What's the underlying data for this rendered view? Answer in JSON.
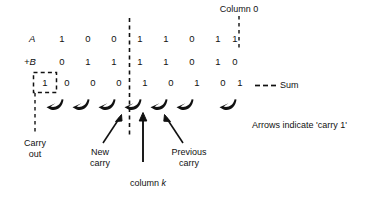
{
  "figure": {
    "labels": {
      "column0": "Column 0",
      "sum": "Sum",
      "arrows_note": "Arrows indicate 'carry 1'",
      "carry_out_line1": "Carry",
      "carry_out_line2": "out",
      "new_carry_line1": "New",
      "new_carry_line2": "carry",
      "previous_carry_line1": "Previous",
      "previous_carry_line2": "carry",
      "column_k_prefix": "column ",
      "column_k_var": "k"
    },
    "rows": [
      {
        "name": "row-a",
        "label": "A",
        "label_plain": "A",
        "digits": [
          "1",
          "0",
          "0",
          "1",
          "1",
          "0",
          "1",
          "1"
        ]
      },
      {
        "name": "row-b",
        "label": "+B",
        "label_plain": "+B",
        "digits": [
          "0",
          "1",
          "1",
          "1",
          "1",
          "0",
          "1",
          "0"
        ]
      },
      {
        "name": "row-sum",
        "label": "",
        "label_plain": "",
        "digits": [
          "0",
          "0",
          "0",
          "1",
          "0",
          "1",
          "0",
          "1"
        ]
      }
    ],
    "carry_out_digit": "1",
    "colors": {
      "ink": "#111111",
      "background": "#ffffff"
    }
  }
}
